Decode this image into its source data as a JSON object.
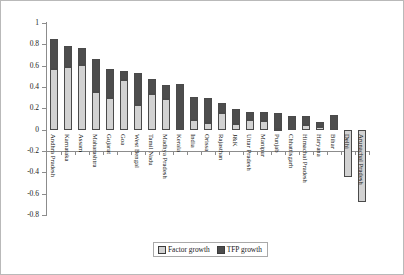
{
  "chart_data": {
    "type": "bar",
    "title": "",
    "subtitle": "",
    "xlabel": "",
    "ylabel": "",
    "ylim": [
      -0.8,
      1
    ],
    "ytick_labels": [
      "1",
      "0.8",
      "0.6",
      "0.4",
      "0.2",
      "0",
      "-0.2",
      "-0.4",
      "-0.6",
      "-0.8"
    ],
    "yticks": [
      1,
      0.8,
      0.6,
      0.4,
      0.2,
      0,
      -0.2,
      -0.4,
      -0.6,
      -0.8
    ],
    "grid": false,
    "stacked": true,
    "legend_position": "bottom-center",
    "categories": [
      "Andhra Pradesh",
      "Karnataka",
      "Assam",
      "Maharashtra",
      "Gujarat",
      "Goa",
      "West Bengal",
      "Tamil Nadu",
      "Madhya Pradesh",
      "Kerala",
      "India",
      "Orissa",
      "Rajasthan",
      "J&K",
      "Uttar Pradesh",
      "Manipur",
      "Punjab",
      "Chhattisgarh",
      "Himachal Pradesh",
      "Haryana",
      "Bihar",
      "Delhi",
      "Arunachal Pradesh"
    ],
    "series": [
      {
        "name": "Factor growth",
        "color": "#d2d2d2",
        "values": [
          0.57,
          0.59,
          0.61,
          0.35,
          0.3,
          0.465,
          0.235,
          0.335,
          0.29,
          0.0,
          0.09,
          0.065,
          0.155,
          0.05,
          0.09,
          0.085,
          0.005,
          0.0,
          0.045,
          0.025,
          0.0,
          -0.44,
          -0.68
        ]
      },
      {
        "name": "TFP growth",
        "color": "#4d4d4d",
        "values": [
          0.28,
          0.19,
          0.16,
          0.315,
          0.265,
          0.085,
          0.3,
          0.14,
          0.13,
          0.425,
          0.22,
          0.235,
          0.095,
          0.14,
          0.075,
          0.08,
          0.155,
          0.13,
          0.08,
          0.05,
          0.135,
          0.0,
          0.0
        ]
      }
    ],
    "totals": [
      0.85,
      0.78,
      0.77,
      0.665,
      0.565,
      0.55,
      0.535,
      0.475,
      0.42,
      0.425,
      0.31,
      0.3,
      0.25,
      0.19,
      0.165,
      0.165,
      0.16,
      0.13,
      0.125,
      0.075,
      0.135,
      -0.44,
      -0.68
    ]
  },
  "legend": {
    "items": [
      {
        "label": "Factor growth",
        "swatch": "light-swatch-icon"
      },
      {
        "label": "TFP growth",
        "swatch": "dark-swatch-icon"
      }
    ]
  }
}
